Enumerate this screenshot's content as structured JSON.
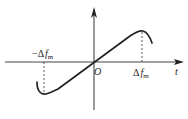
{
  "diagram": {
    "type": "frequency-deviation-curve",
    "axes": {
      "horizontal_label": "t",
      "origin_label": "O"
    },
    "markers": {
      "positive": {
        "delta": "Δ",
        "symbol": "f",
        "subscript": "m",
        "sign": ""
      },
      "negative": {
        "delta": "Δ",
        "symbol": "f",
        "subscript": "m",
        "sign": "−"
      }
    },
    "colors": {
      "line": "#222222",
      "axis": "#444444",
      "background": "#ffffff"
    }
  }
}
